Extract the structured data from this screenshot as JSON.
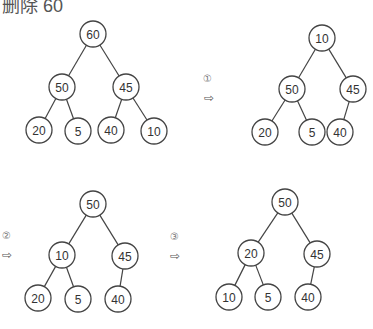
{
  "title": "删除 60",
  "colors": {
    "stroke": "#444444",
    "text": "#333333",
    "background": "#ffffff"
  },
  "steps": [
    {
      "label": "",
      "tree": {
        "nodes": [
          {
            "id": "a",
            "value": "60",
            "x": 93,
            "y": 34
          },
          {
            "id": "b",
            "value": "50",
            "x": 62,
            "y": 87
          },
          {
            "id": "c",
            "value": "45",
            "x": 126,
            "y": 87
          },
          {
            "id": "d",
            "value": "20",
            "x": 39,
            "y": 130
          },
          {
            "id": "e",
            "value": "5",
            "x": 78,
            "y": 131
          },
          {
            "id": "f",
            "value": "40",
            "x": 111,
            "y": 130
          },
          {
            "id": "g",
            "value": "10",
            "x": 154,
            "y": 131
          }
        ],
        "edges": [
          [
            "a",
            "b"
          ],
          [
            "a",
            "c"
          ],
          [
            "b",
            "d"
          ],
          [
            "b",
            "e"
          ],
          [
            "c",
            "f"
          ],
          [
            "c",
            "g"
          ]
        ]
      }
    },
    {
      "label": "①",
      "marker": {
        "num_x": 203,
        "num_y": 74,
        "arrow_x": 204,
        "arrow_y": 92
      },
      "tree": {
        "nodes": [
          {
            "id": "a",
            "value": "10",
            "x": 322,
            "y": 38
          },
          {
            "id": "b",
            "value": "50",
            "x": 292,
            "y": 89
          },
          {
            "id": "c",
            "value": "45",
            "x": 353,
            "y": 89
          },
          {
            "id": "d",
            "value": "20",
            "x": 265,
            "y": 132
          },
          {
            "id": "e",
            "value": "5",
            "x": 312,
            "y": 132
          },
          {
            "id": "f",
            "value": "40",
            "x": 340,
            "y": 132
          }
        ],
        "edges": [
          [
            "a",
            "b"
          ],
          [
            "a",
            "c"
          ],
          [
            "b",
            "d"
          ],
          [
            "b",
            "e"
          ],
          [
            "c",
            "f"
          ]
        ]
      }
    },
    {
      "label": "②",
      "marker": {
        "num_x": 2,
        "num_y": 231,
        "arrow_x": 2,
        "arrow_y": 249
      },
      "tree": {
        "nodes": [
          {
            "id": "a",
            "value": "50",
            "x": 93,
            "y": 204
          },
          {
            "id": "b",
            "value": "10",
            "x": 62,
            "y": 255
          },
          {
            "id": "c",
            "value": "45",
            "x": 125,
            "y": 256
          },
          {
            "id": "d",
            "value": "20",
            "x": 38,
            "y": 298
          },
          {
            "id": "e",
            "value": "5",
            "x": 78,
            "y": 299
          },
          {
            "id": "f",
            "value": "40",
            "x": 118,
            "y": 299
          }
        ],
        "edges": [
          [
            "a",
            "b"
          ],
          [
            "a",
            "c"
          ],
          [
            "b",
            "d"
          ],
          [
            "b",
            "e"
          ],
          [
            "c",
            "f"
          ]
        ]
      }
    },
    {
      "label": "③",
      "marker": {
        "num_x": 170,
        "num_y": 232,
        "arrow_x": 170,
        "arrow_y": 250
      },
      "tree": {
        "nodes": [
          {
            "id": "a",
            "value": "50",
            "x": 285,
            "y": 202
          },
          {
            "id": "b",
            "value": "20",
            "x": 251,
            "y": 253
          },
          {
            "id": "c",
            "value": "45",
            "x": 317,
            "y": 254
          },
          {
            "id": "d",
            "value": "10",
            "x": 229,
            "y": 297
          },
          {
            "id": "e",
            "value": "5",
            "x": 268,
            "y": 297
          },
          {
            "id": "f",
            "value": "40",
            "x": 308,
            "y": 297
          }
        ],
        "edges": [
          [
            "a",
            "b"
          ],
          [
            "a",
            "c"
          ],
          [
            "b",
            "d"
          ],
          [
            "b",
            "e"
          ],
          [
            "c",
            "f"
          ]
        ]
      }
    }
  ],
  "arrow_glyph": "⇨",
  "node_radius": 13
}
